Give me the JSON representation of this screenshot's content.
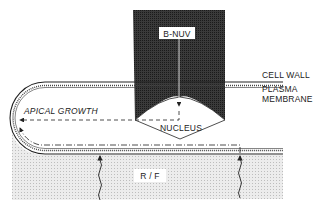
{
  "diagram": {
    "labels": {
      "beam": "B-NUV",
      "cell_wall": "CELL WALL",
      "plasma": "PLASMA",
      "membrane": "MEMBRANE",
      "growth": "APICAL GROWTH",
      "nucleus": "NUCLEUS",
      "region": "R / F"
    },
    "colors": {
      "beam_fill": "#2b2b2b",
      "region_fill": "#e6e6e6",
      "line": "#222222",
      "background": "#ffffff"
    }
  }
}
